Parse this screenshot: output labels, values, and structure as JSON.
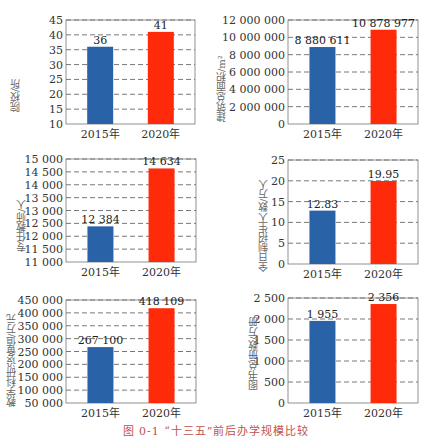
{
  "caption": "图 0-1 “十三五”前后办学规模比较",
  "colors": {
    "bar_2015": "#2a62a8",
    "bar_2020": "#ff2a0a",
    "grid": "#555555",
    "axis": "#777777",
    "caption": "#c0504d"
  },
  "chart_data": [
    {
      "type": "bar",
      "title": "",
      "ylabel": "院校/所",
      "categories": [
        "2015年",
        "2020年"
      ],
      "values": [
        36,
        41
      ],
      "value_labels": [
        "36",
        "41"
      ],
      "ylim": [
        10,
        45
      ],
      "yticks": [
        10,
        15,
        20,
        25,
        30,
        35,
        40,
        45
      ],
      "ytick_labels": [
        "10",
        "15",
        "20",
        "25",
        "30",
        "35",
        "40",
        "45"
      ],
      "grid": true
    },
    {
      "type": "bar",
      "title": "",
      "ylabel": "建筑总面积/m²",
      "categories": [
        "2015年",
        "2020年"
      ],
      "values": [
        8880611,
        10878977
      ],
      "value_labels": [
        "8 880 611",
        "10 878 977"
      ],
      "ylim": [
        0,
        12000000
      ],
      "yticks": [
        0,
        2000000,
        4000000,
        6000000,
        8000000,
        10000000,
        12000000
      ],
      "ytick_labels": [
        "0",
        "2 000 000",
        "4 000 000",
        "6 000 000",
        "8 000 000",
        "10 000 000",
        "12 000 000"
      ],
      "grid": true
    },
    {
      "type": "bar",
      "title": "",
      "ylabel": "专任教师/人",
      "categories": [
        "2015年",
        "2020年"
      ],
      "values": [
        12384,
        14634
      ],
      "value_labels": [
        "12 384",
        "14 634"
      ],
      "ylim": [
        11000,
        15000
      ],
      "yticks": [
        11000,
        11500,
        12000,
        12500,
        13000,
        13500,
        14000,
        14500,
        15000
      ],
      "ytick_labels": [
        "11 000",
        "11 500",
        "12 000",
        "12 500",
        "13 000",
        "13 500",
        "14 000",
        "14 500",
        "15 000"
      ],
      "grid": true
    },
    {
      "type": "bar",
      "title": "",
      "ylabel": "全日制招生人数/万人",
      "categories": [
        "2015年",
        "2020年"
      ],
      "values": [
        12.83,
        19.95
      ],
      "value_labels": [
        "12.83",
        "19.95"
      ],
      "ylim": [
        0,
        25
      ],
      "yticks": [
        0,
        5,
        10,
        15,
        20,
        25
      ],
      "ytick_labels": [
        "0",
        "5",
        "10",
        "15",
        "20",
        "25"
      ],
      "grid": true
    },
    {
      "type": "bar",
      "title": "",
      "ylabel": "教学科研设备值/万元",
      "categories": [
        "2015年",
        "2020年"
      ],
      "values": [
        267100,
        418109
      ],
      "value_labels": [
        "267 100",
        "418 109"
      ],
      "ylim": [
        50000,
        450000
      ],
      "yticks": [
        50000,
        100000,
        150000,
        200000,
        250000,
        300000,
        350000,
        400000,
        450000
      ],
      "ytick_labels": [
        "50 000",
        "100 000",
        "150 000",
        "200 000",
        "250 000",
        "300 000",
        "350 000",
        "400 000",
        "450 000"
      ],
      "grid": true
    },
    {
      "type": "bar",
      "title": "",
      "ylabel": "图书总册数/万册",
      "categories": [
        "2015年",
        "2020年"
      ],
      "values": [
        1955,
        2356
      ],
      "value_labels": [
        "1 955",
        "2 356"
      ],
      "ylim": [
        0,
        2500
      ],
      "yticks": [
        0,
        500,
        1000,
        1500,
        2000,
        2500
      ],
      "ytick_labels": [
        "0",
        "500",
        "1 000",
        "1 500",
        "2 000",
        "2 500"
      ],
      "grid": true
    }
  ]
}
